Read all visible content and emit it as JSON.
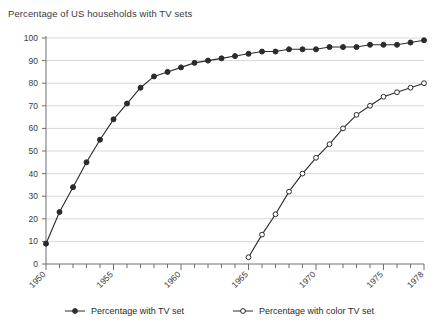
{
  "chart_data": {
    "type": "line",
    "title": "Percentage of US households with TV sets",
    "xlabel": "",
    "ylabel": "",
    "xlim": [
      1950,
      1978
    ],
    "ylim": [
      0,
      100
    ],
    "grid": true,
    "grid_axis": "y",
    "legend_position": "bottom",
    "yticks": [
      0,
      10,
      20,
      30,
      40,
      50,
      60,
      70,
      80,
      90,
      100
    ],
    "ytick_labels": [
      "0",
      "10",
      "20",
      "30",
      "40",
      "50",
      "60",
      "70",
      "80",
      "90",
      "100"
    ],
    "xticks": [
      1950,
      1955,
      1960,
      1965,
      1970,
      1975,
      1978
    ],
    "xtick_labels": [
      "1950",
      "1955",
      "1960",
      "1965",
      "1970",
      "1975",
      "1978"
    ],
    "xtick_minor_every": 1,
    "x": [
      1950,
      1951,
      1952,
      1953,
      1954,
      1955,
      1956,
      1957,
      1958,
      1959,
      1960,
      1961,
      1962,
      1963,
      1964,
      1965,
      1966,
      1967,
      1968,
      1969,
      1970,
      1971,
      1972,
      1973,
      1974,
      1975,
      1976,
      1977,
      1978
    ],
    "series": [
      {
        "name": "Percentage with TV set",
        "marker": "filled-circle",
        "line_style": "solid",
        "color": "#2b2b2b",
        "x": [
          1950,
          1951,
          1952,
          1953,
          1954,
          1955,
          1956,
          1957,
          1958,
          1959,
          1960,
          1961,
          1962,
          1963,
          1964,
          1965,
          1966,
          1967,
          1968,
          1969,
          1970,
          1971,
          1972,
          1973,
          1974,
          1975,
          1976,
          1977,
          1978
        ],
        "values": [
          9,
          23,
          34,
          45,
          55,
          64,
          71,
          78,
          83,
          85,
          87,
          89,
          90,
          91,
          92,
          93,
          94,
          94,
          95,
          95,
          95,
          96,
          96,
          96,
          97,
          97,
          97,
          98,
          99
        ]
      },
      {
        "name": "Percentage with color TV set",
        "marker": "open-circle",
        "line_style": "solid",
        "color": "#2b2b2b",
        "x": [
          1965,
          1966,
          1967,
          1968,
          1969,
          1970,
          1971,
          1972,
          1973,
          1974,
          1975,
          1976,
          1977,
          1978
        ],
        "values": [
          3,
          13,
          22,
          32,
          40,
          47,
          53,
          60,
          66,
          70,
          74,
          76,
          78,
          80
        ]
      }
    ]
  },
  "legend": {
    "entries": [
      {
        "label": "Percentage with TV set",
        "marker": "filled-circle"
      },
      {
        "label": "Percentage with color TV set",
        "marker": "open-circle"
      }
    ]
  },
  "colors": {
    "line": "#2b2b2b",
    "grid": "#d9d9d9",
    "axis": "#6e6e6e",
    "text": "#2b2b2b",
    "background": "#ffffff"
  }
}
